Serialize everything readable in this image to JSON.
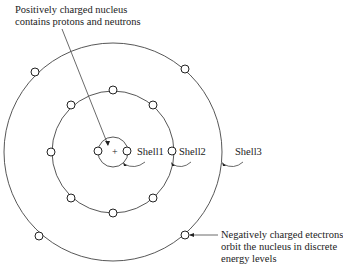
{
  "diagram": {
    "type": "atom-shell-model",
    "nucleus": {
      "symbol": "+",
      "label_line1": "Positively charged nucleus",
      "label_line2": "contains protons and neutrons"
    },
    "shells": [
      {
        "name": "Shell1",
        "electrons": 2
      },
      {
        "name": "Shell2",
        "electrons": 8
      },
      {
        "name": "Shell3",
        "electrons": 4
      }
    ],
    "electron_note": {
      "line1": "Negatively charged etectrons",
      "line2": "orbit the nucleus in discrete",
      "line3": "energy levels"
    }
  }
}
